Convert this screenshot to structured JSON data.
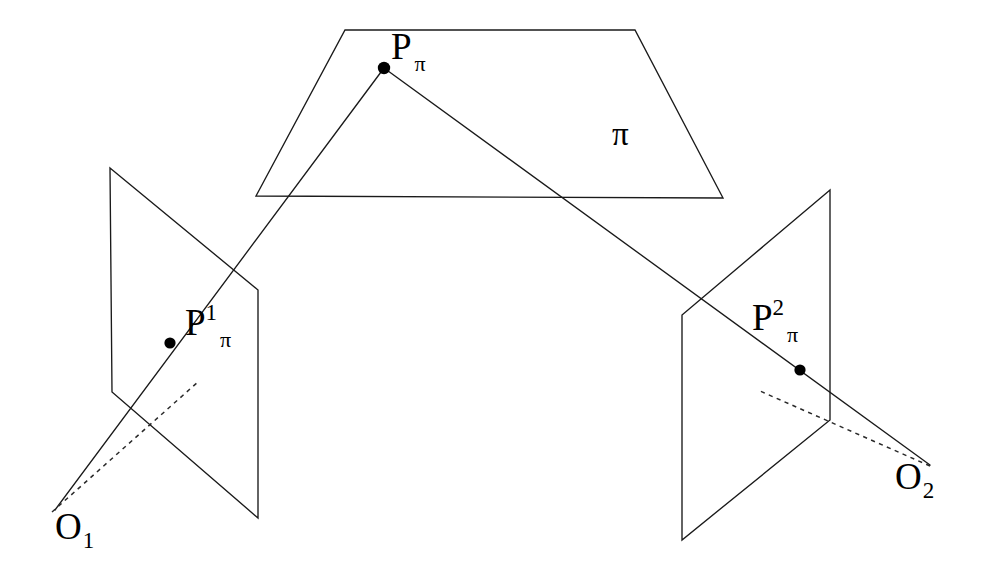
{
  "figure": {
    "background_color": "#ffffff",
    "stroke_color": "#1a1a1a",
    "width": 981,
    "height": 587
  },
  "labels": {
    "scene_point": {
      "base": "P",
      "subscript": "π",
      "full": "Pπ"
    },
    "plane_pi": {
      "text": "π"
    },
    "image_point_left": {
      "base": "P",
      "superscript": "1",
      "subscript": "π",
      "full": "P1π"
    },
    "image_point_right": {
      "base": "P",
      "superscript": "2",
      "subscript": "π",
      "full": "P2π"
    },
    "camera_center_left": {
      "base": "O",
      "subscript": "1",
      "full": "O1"
    },
    "camera_center_right": {
      "base": "O",
      "subscript": "2",
      "full": "O2"
    }
  },
  "geometry": {
    "plane_pi_polygon": "345,30 635,30 723,198 256,196",
    "image_plane_left_polygon": "110,168 258,290 258,518 112,392",
    "image_plane_right_polygon": "830,190 682,315 682,540 830,420",
    "ray_left_scene_to_center": "384,68 55,510",
    "ray_right_scene_to_center": "384,68 930,465",
    "dashed_left": "52,512 199,381",
    "dashed_right": "930,466 760,391",
    "dot_scene_point": {
      "cx": 384,
      "cy": 68,
      "r": 6.2
    },
    "dot_image_point_left": {
      "cx": 170,
      "cy": 343,
      "r": 5.6
    },
    "dot_image_point_right": {
      "cx": 800,
      "cy": 370,
      "r": 5.6
    }
  }
}
